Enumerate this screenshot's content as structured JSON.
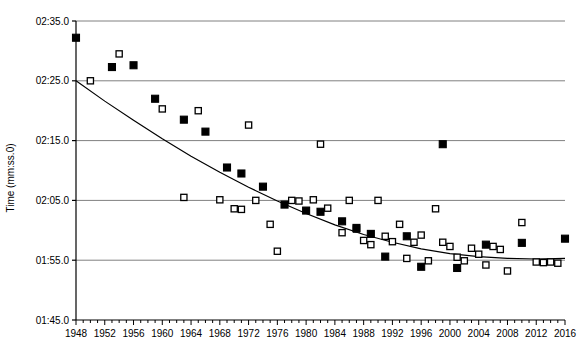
{
  "chart_data": {
    "type": "scatter",
    "title": "",
    "xlabel": "",
    "ylabel": "Time (mm:ss.0)",
    "grid": true,
    "legend": "none",
    "xlim": [
      1948,
      2016
    ],
    "ylim_seconds": [
      105,
      155
    ],
    "y_tick_labels": [
      "02:35.0",
      "02:25.0",
      "02:15.0",
      "02:05.0",
      "01:55.0",
      "01:45.0"
    ],
    "y_tick_seconds": [
      155,
      145,
      135,
      125,
      115,
      105
    ],
    "x_tick_labels": [
      "1948",
      "1952",
      "1956",
      "1960",
      "1964",
      "1968",
      "1972",
      "1976",
      "1980",
      "1984",
      "1988",
      "1992",
      "1996",
      "2000",
      "2004",
      "2008",
      "2012",
      "2016"
    ],
    "x_tick_values": [
      1948,
      1952,
      1956,
      1960,
      1964,
      1968,
      1972,
      1976,
      1980,
      1984,
      1988,
      1992,
      1996,
      2000,
      2004,
      2008,
      2012,
      2016
    ],
    "x_minor_tick_step": 1,
    "series": [
      {
        "name": "filled-series",
        "marker": "filled-square",
        "color": "#000000",
        "points": [
          [
            1948,
            152.2
          ],
          [
            1953,
            147.3
          ],
          [
            1956,
            147.6
          ],
          [
            1959,
            142.0
          ],
          [
            1963,
            138.5
          ],
          [
            1966,
            136.5
          ],
          [
            1969,
            130.5
          ],
          [
            1971,
            129.5
          ],
          [
            1974,
            127.3
          ],
          [
            1977,
            124.3
          ],
          [
            1980,
            123.3
          ],
          [
            1982,
            123.1
          ],
          [
            1985,
            121.5
          ],
          [
            1987,
            120.4
          ],
          [
            1989,
            119.4
          ],
          [
            1991,
            115.6
          ],
          [
            1994,
            119.0
          ],
          [
            1996,
            113.9
          ],
          [
            1999,
            134.4
          ],
          [
            2001,
            113.7
          ],
          [
            2005,
            117.6
          ],
          [
            2010,
            117.9
          ],
          [
            2016,
            118.6
          ]
        ]
      },
      {
        "name": "open-series",
        "marker": "open-square",
        "color": "#000000",
        "points": [
          [
            1950,
            145.0
          ],
          [
            1954,
            149.5
          ],
          [
            1960,
            140.3
          ],
          [
            1963,
            125.5
          ],
          [
            1965,
            140.0
          ],
          [
            1968,
            125.1
          ],
          [
            1970,
            123.6
          ],
          [
            1971,
            123.5
          ],
          [
            1972,
            137.6
          ],
          [
            1973,
            125.0
          ],
          [
            1975,
            121.0
          ],
          [
            1976,
            116.5
          ],
          [
            1978,
            125.0
          ],
          [
            1979,
            124.9
          ],
          [
            1981,
            125.1
          ],
          [
            1982,
            134.4
          ],
          [
            1983,
            123.7
          ],
          [
            1985,
            119.6
          ],
          [
            1986,
            125.0
          ],
          [
            1987,
            120.2
          ],
          [
            1988,
            118.3
          ],
          [
            1989,
            117.6
          ],
          [
            1990,
            125.0
          ],
          [
            1991,
            119.0
          ],
          [
            1992,
            118.1
          ],
          [
            1993,
            121.0
          ],
          [
            1994,
            115.3
          ],
          [
            1995,
            118.0
          ],
          [
            1996,
            119.2
          ],
          [
            1997,
            114.9
          ],
          [
            1998,
            123.6
          ],
          [
            1999,
            118.0
          ],
          [
            2000,
            117.3
          ],
          [
            2001,
            115.5
          ],
          [
            2002,
            114.9
          ],
          [
            2003,
            117.0
          ],
          [
            2004,
            116.0
          ],
          [
            2005,
            114.2
          ],
          [
            2006,
            117.3
          ],
          [
            2007,
            116.8
          ],
          [
            2008,
            113.2
          ],
          [
            2010,
            121.3
          ],
          [
            2012,
            114.7
          ],
          [
            2013,
            114.6
          ],
          [
            2014,
            114.7
          ],
          [
            2015,
            114.5
          ]
        ]
      }
    ],
    "trend_line": {
      "name": "fitted-trend-curve",
      "color": "#000000",
      "points": [
        [
          1948.0,
          145.0
        ],
        [
          1952.0,
          141.6
        ],
        [
          1956.0,
          138.4
        ],
        [
          1960.0,
          135.3
        ],
        [
          1964.0,
          132.4
        ],
        [
          1968.0,
          129.7
        ],
        [
          1972.0,
          127.2
        ],
        [
          1976.0,
          124.9
        ],
        [
          1980.0,
          122.8
        ],
        [
          1984.0,
          120.9
        ],
        [
          1988.0,
          119.3
        ],
        [
          1992.0,
          118.0
        ],
        [
          1996.0,
          116.9
        ],
        [
          2000.0,
          116.1
        ],
        [
          2004.0,
          115.6
        ],
        [
          2008.0,
          115.3
        ],
        [
          2012.0,
          115.2
        ],
        [
          2016.0,
          115.3
        ]
      ]
    }
  },
  "axes": {
    "y_axis_title": "Time (mm:ss.0)",
    "gridline_color": "#808080",
    "axis_color": "#000000"
  }
}
